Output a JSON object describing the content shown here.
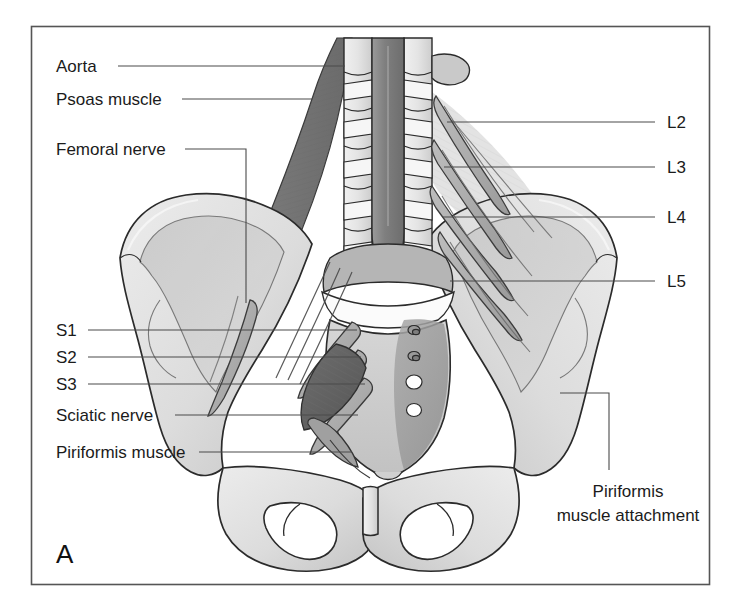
{
  "figure": {
    "panel_label": "A",
    "frame_color": "#555555",
    "background_color": "#ffffff",
    "style": "grayscale-medical-illustration"
  },
  "labels_left": [
    {
      "id": "aorta",
      "text": "Aorta",
      "x": 56,
      "y": 72,
      "leader": {
        "type": "straight",
        "x1": 118,
        "y1": 66,
        "x2": 345,
        "y2": 66
      }
    },
    {
      "id": "psoas",
      "text": "Psoas muscle",
      "x": 56,
      "y": 105,
      "leader": {
        "type": "straight",
        "x1": 182,
        "y1": 99,
        "x2": 312,
        "y2": 99
      }
    },
    {
      "id": "femoral",
      "text": "Femoral nerve",
      "x": 56,
      "y": 155,
      "leader": {
        "type": "elbow-down",
        "x1": 185,
        "y1": 149,
        "x2": 246,
        "y2": 149,
        "x3": 246,
        "y3": 303
      }
    },
    {
      "id": "s1",
      "text": "S1",
      "x": 56,
      "y": 336,
      "leader": {
        "type": "straight",
        "x1": 88,
        "y1": 330,
        "x2": 357,
        "y2": 330
      }
    },
    {
      "id": "s2",
      "text": "S2",
      "x": 56,
      "y": 363,
      "leader": {
        "type": "straight",
        "x1": 88,
        "y1": 357,
        "x2": 361,
        "y2": 357
      }
    },
    {
      "id": "s3",
      "text": "S3",
      "x": 56,
      "y": 390,
      "leader": {
        "type": "straight",
        "x1": 88,
        "y1": 384,
        "x2": 365,
        "y2": 384
      }
    },
    {
      "id": "sciatic",
      "text": "Sciatic nerve",
      "x": 56,
      "y": 421,
      "leader": {
        "type": "straight",
        "x1": 175,
        "y1": 415,
        "x2": 358,
        "y2": 415
      }
    },
    {
      "id": "piriformis",
      "text": "Piriformis muscle",
      "x": 56,
      "y": 458,
      "leader": {
        "type": "straight",
        "x1": 199,
        "y1": 452,
        "x2": 352,
        "y2": 452
      }
    }
  ],
  "labels_right": [
    {
      "id": "l2",
      "text": "L2",
      "x": 667,
      "y": 128,
      "leader": {
        "type": "straight",
        "x1": 655,
        "y1": 122,
        "x2": 447,
        "y2": 122
      }
    },
    {
      "id": "l3",
      "text": "L3",
      "x": 667,
      "y": 173,
      "leader": {
        "type": "straight",
        "x1": 655,
        "y1": 167,
        "x2": 444,
        "y2": 167
      }
    },
    {
      "id": "l4",
      "text": "L4",
      "x": 667,
      "y": 223,
      "leader": {
        "type": "straight",
        "x1": 655,
        "y1": 217,
        "x2": 443,
        "y2": 217
      }
    },
    {
      "id": "l5",
      "text": "L5",
      "x": 667,
      "y": 287,
      "leader": {
        "type": "straight",
        "x1": 655,
        "y1": 281,
        "x2": 450,
        "y2": 281
      }
    }
  ],
  "caption_right": {
    "id": "piriformis-attachment",
    "line1": "Piriformis",
    "line2": "muscle attachment",
    "x": 628,
    "y1": 497,
    "y2": 521,
    "leader": {
      "type": "elbow-up",
      "x1": 609,
      "y1": 470,
      "x2": 609,
      "y2": 393,
      "x3": 560,
      "y3": 393
    }
  },
  "palette": {
    "bone_light": "#e2e2e2",
    "bone_mid": "#cfcfcf",
    "bone_shadow": "#b6b6b6",
    "bone_edge": "#2b2b2b",
    "muscle_dark": "#787878",
    "muscle_darker": "#5f5f5f",
    "vessel": "#8a8a8a",
    "nerve": "#a8a8a8",
    "attachment": "#9c9c9c",
    "foramen": "#ffffff"
  },
  "anatomy_parts": [
    {
      "name": "aorta",
      "tone": "vessel"
    },
    {
      "name": "lumbar-vertebrae",
      "tone": "bone_light"
    },
    {
      "name": "psoas-muscle",
      "tone": "muscle_dark"
    },
    {
      "name": "iliac-wing-left",
      "tone": "bone_light"
    },
    {
      "name": "iliac-wing-right",
      "tone": "bone_light"
    },
    {
      "name": "sacrum",
      "tone": "bone_mid"
    },
    {
      "name": "sacral-foramina",
      "tone": "foramen"
    },
    {
      "name": "piriformis-muscle",
      "tone": "muscle_darker"
    },
    {
      "name": "piriformis-attachment-area",
      "tone": "attachment"
    },
    {
      "name": "lumbar-nerve-roots",
      "tone": "nerve"
    },
    {
      "name": "sacral-nerve-roots",
      "tone": "nerve"
    },
    {
      "name": "sciatic-nerve",
      "tone": "nerve"
    },
    {
      "name": "obturator-foramen-left",
      "tone": "foramen"
    },
    {
      "name": "obturator-foramen-right",
      "tone": "foramen"
    },
    {
      "name": "pubic-symphysis",
      "tone": "bone_light"
    }
  ]
}
